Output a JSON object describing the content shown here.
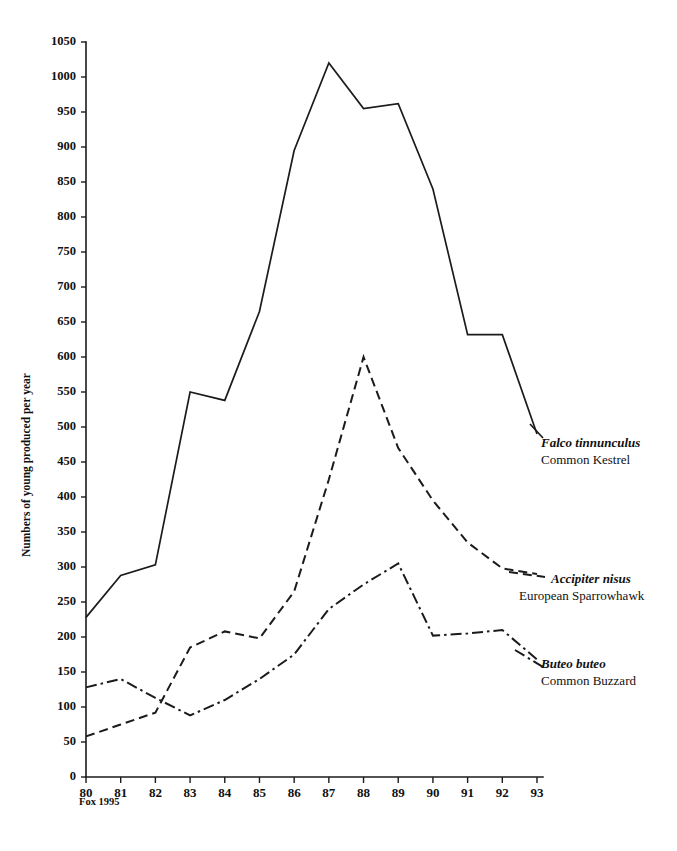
{
  "chart_data": {
    "type": "line",
    "title": "",
    "xlabel": "",
    "ylabel": "Numbers of young produced per year",
    "source_note": "Fox 1995",
    "x": [
      "80",
      "81",
      "82",
      "83",
      "84",
      "85",
      "86",
      "87",
      "88",
      "89",
      "90",
      "91",
      "92",
      "93"
    ],
    "xlim": [
      80,
      93
    ],
    "ylim": [
      0,
      1050
    ],
    "ytick_labels": [
      "0",
      "50",
      "100",
      "150",
      "200",
      "250",
      "300",
      "350",
      "400",
      "450",
      "500",
      "550",
      "600",
      "650",
      "700",
      "750",
      "800",
      "850",
      "900",
      "950",
      "1000",
      "1050"
    ],
    "ytick_values": [
      0,
      50,
      100,
      150,
      200,
      250,
      300,
      350,
      400,
      450,
      500,
      550,
      600,
      650,
      700,
      750,
      800,
      850,
      900,
      950,
      1000,
      1050
    ],
    "ytick_step": 50,
    "grid": false,
    "legend_position": "right-inline",
    "line_color": "#1b1b1b",
    "series": [
      {
        "name": "Falco tinnunculus",
        "common_name": "Common Kestrel",
        "style": "solid",
        "values": [
          228,
          288,
          303,
          550,
          538,
          665,
          895,
          1020,
          955,
          962,
          840,
          632,
          632,
          490
        ]
      },
      {
        "name": "Accipiter nisus",
        "common_name": "European Sparrowhawk",
        "style": "dashed",
        "values": [
          58,
          75,
          92,
          185,
          208,
          198,
          265,
          425,
          600,
          470,
          395,
          335,
          298,
          290
        ]
      },
      {
        "name": "Buteo buteo",
        "common_name": "Common Buzzard",
        "style": "dash-dot",
        "values": [
          128,
          140,
          113,
          88,
          110,
          140,
          175,
          240,
          275,
          305,
          202,
          205,
          210,
          168
        ]
      }
    ]
  },
  "legend": [
    {
      "scientific": "Falco tinnunculus",
      "common": "Common Kestrel",
      "style": "solid"
    },
    {
      "scientific": "Accipiter nisus",
      "common": "European Sparrowhawk",
      "style": "dashed"
    },
    {
      "scientific": "Buteo buteo",
      "common": "Common Buzzard",
      "style": "dash-dot"
    }
  ]
}
